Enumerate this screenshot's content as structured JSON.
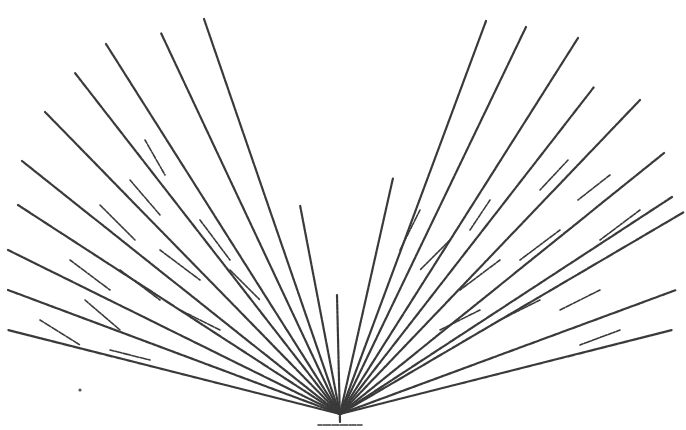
{
  "figure": {
    "ink_color": "#3a3a3a",
    "background": "#ffffff",
    "base": {
      "x": 340,
      "y": 422
    },
    "trunk": {
      "x1": 340,
      "y1": 422,
      "x2": 337,
      "y2": 295
    },
    "ground": {
      "x1": 318,
      "y1": 425,
      "x2": 362,
      "y2": 425
    },
    "main_branches": [
      [
        204,
        19
      ],
      [
        161,
        33
      ],
      [
        106,
        44
      ],
      [
        75,
        73
      ],
      [
        45,
        112
      ],
      [
        22,
        161
      ],
      [
        18,
        205
      ],
      [
        8,
        250
      ],
      [
        8,
        290
      ],
      [
        8,
        330
      ],
      [
        486,
        21
      ],
      [
        526,
        27
      ],
      [
        578,
        38
      ],
      [
        594,
        87
      ],
      [
        640,
        100
      ],
      [
        664,
        153
      ],
      [
        672,
        197
      ],
      [
        684,
        212
      ],
      [
        676,
        290
      ],
      [
        672,
        330
      ],
      [
        393,
        178
      ],
      [
        300,
        205
      ]
    ],
    "twigs": [
      [
        [
          145,
          140
        ],
        [
          165,
          175
        ]
      ],
      [
        [
          130,
          180
        ],
        [
          160,
          215
        ]
      ],
      [
        [
          100,
          205
        ],
        [
          135,
          240
        ]
      ],
      [
        [
          70,
          260
        ],
        [
          110,
          290
        ]
      ],
      [
        [
          40,
          320
        ],
        [
          80,
          345
        ]
      ],
      [
        [
          85,
          300
        ],
        [
          120,
          330
        ]
      ],
      [
        [
          120,
          270
        ],
        [
          160,
          300
        ]
      ],
      [
        [
          160,
          250
        ],
        [
          200,
          280
        ]
      ],
      [
        [
          110,
          350
        ],
        [
          150,
          360
        ]
      ],
      [
        [
          180,
          310
        ],
        [
          220,
          330
        ]
      ],
      [
        [
          230,
          270
        ],
        [
          260,
          300
        ]
      ],
      [
        [
          200,
          220
        ],
        [
          230,
          260
        ]
      ],
      [
        [
          568,
          160
        ],
        [
          540,
          190
        ]
      ],
      [
        [
          610,
          175
        ],
        [
          578,
          200
        ]
      ],
      [
        [
          640,
          210
        ],
        [
          600,
          240
        ]
      ],
      [
        [
          560,
          230
        ],
        [
          520,
          260
        ]
      ],
      [
        [
          500,
          260
        ],
        [
          460,
          290
        ]
      ],
      [
        [
          540,
          300
        ],
        [
          500,
          320
        ]
      ],
      [
        [
          600,
          290
        ],
        [
          560,
          310
        ]
      ],
      [
        [
          620,
          330
        ],
        [
          580,
          345
        ]
      ],
      [
        [
          480,
          310
        ],
        [
          440,
          330
        ]
      ],
      [
        [
          450,
          240
        ],
        [
          420,
          270
        ]
      ],
      [
        [
          490,
          200
        ],
        [
          470,
          230
        ]
      ],
      [
        [
          420,
          210
        ],
        [
          400,
          250
        ]
      ]
    ],
    "stray_dot": {
      "x": 80,
      "y": 390
    }
  }
}
